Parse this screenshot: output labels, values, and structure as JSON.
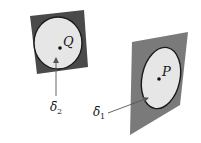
{
  "diagram": {
    "colors": {
      "left_plane": "#4a4a4a",
      "right_plane": "#7a7a7a",
      "disc_fill": "#e6e6e6",
      "outline": "#1a1a1a",
      "arrow": "#555555"
    },
    "left_panel": {
      "point_label": "Q",
      "arrow_label": "δ̄",
      "arrow_subscript": "2"
    },
    "right_panel": {
      "point_label": "P",
      "arrow_label": "δ̄",
      "arrow_subscript": "1"
    }
  }
}
